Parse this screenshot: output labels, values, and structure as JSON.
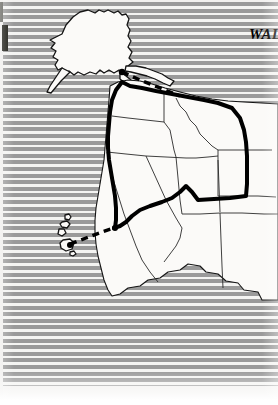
{
  "page": {
    "kind": "scanned-print-page",
    "background_pattern": "horizontal-stripes",
    "stripe_color": "#9a9a9a",
    "stripe_gap_color": "#f4f4f2",
    "paper_color": "#f2f1ef"
  },
  "title": {
    "line1": "THE",
    "line2": "WALK FOR T",
    "style": "bold-italic-serif",
    "alignment": "right",
    "clipped_at_right_edge": true,
    "color": "#000000"
  },
  "map": {
    "name": "western-united-states-alaska-hawaii",
    "land_fill": "#fbfaf8",
    "border_color": "#1a1a1a",
    "route_color": "#000000",
    "regions": [
      {
        "id": "alaska",
        "label": "Alaska"
      },
      {
        "id": "hawaii",
        "label": "Hawaii"
      },
      {
        "id": "washington",
        "label": "Washington"
      },
      {
        "id": "oregon",
        "label": "Oregon"
      },
      {
        "id": "idaho",
        "label": "Idaho"
      },
      {
        "id": "montana",
        "label": "Montana"
      },
      {
        "id": "california",
        "label": "California"
      },
      {
        "id": "nevada",
        "label": "Nevada"
      },
      {
        "id": "utah",
        "label": "Utah"
      },
      {
        "id": "wyoming",
        "label": "Wyoming"
      },
      {
        "id": "arizona",
        "label": "Arizona"
      },
      {
        "id": "colorado",
        "label": "Colorado"
      },
      {
        "id": "new-mexico",
        "label": "New Mexico"
      }
    ],
    "routes": [
      {
        "id": "route-alaska-to-mainland",
        "style": "dashed",
        "label": "Alaska to mainland leg"
      },
      {
        "id": "route-hawaii-to-mainland",
        "style": "dashed",
        "label": "Hawaii to mainland leg"
      },
      {
        "id": "route-overland-west-coast",
        "style": "solid-thick",
        "label": "Overland walking route"
      }
    ]
  },
  "marks": {
    "left_dark_bar": "#16160f",
    "left_edge_strip": "#efeeec"
  }
}
